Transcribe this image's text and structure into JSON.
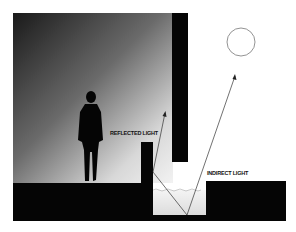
{
  "diagram": {
    "labels": {
      "reflected": "REFLECTED LIGHT",
      "indirect": "INDIRECT LIGHT"
    },
    "elements": [
      "gradient-wall",
      "human-silhouette",
      "overhang-column",
      "ledge-block",
      "water-pool",
      "sun",
      "light-rays"
    ],
    "colors": {
      "solid": "#050505",
      "sun_stroke": "#777777",
      "ray": "#333333"
    }
  }
}
